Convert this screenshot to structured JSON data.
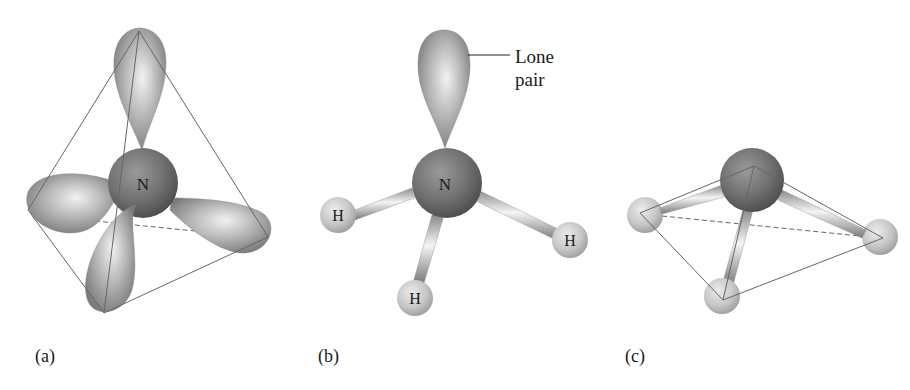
{
  "figure": {
    "panels": [
      {
        "id": "a",
        "label": "(a)",
        "central_atom": "N",
        "description": "sp3 hybrid orbitals of nitrogen in a tetrahedron"
      },
      {
        "id": "b",
        "label": "(b)",
        "central_atom": "N",
        "hydrogens": [
          "H",
          "H",
          "H"
        ],
        "annotation": {
          "line1": "Lone",
          "line2": "pair"
        }
      },
      {
        "id": "c",
        "label": "(c)",
        "description": "trigonal pyramidal ammonia molecule inside tetrahedron outline"
      }
    ]
  }
}
